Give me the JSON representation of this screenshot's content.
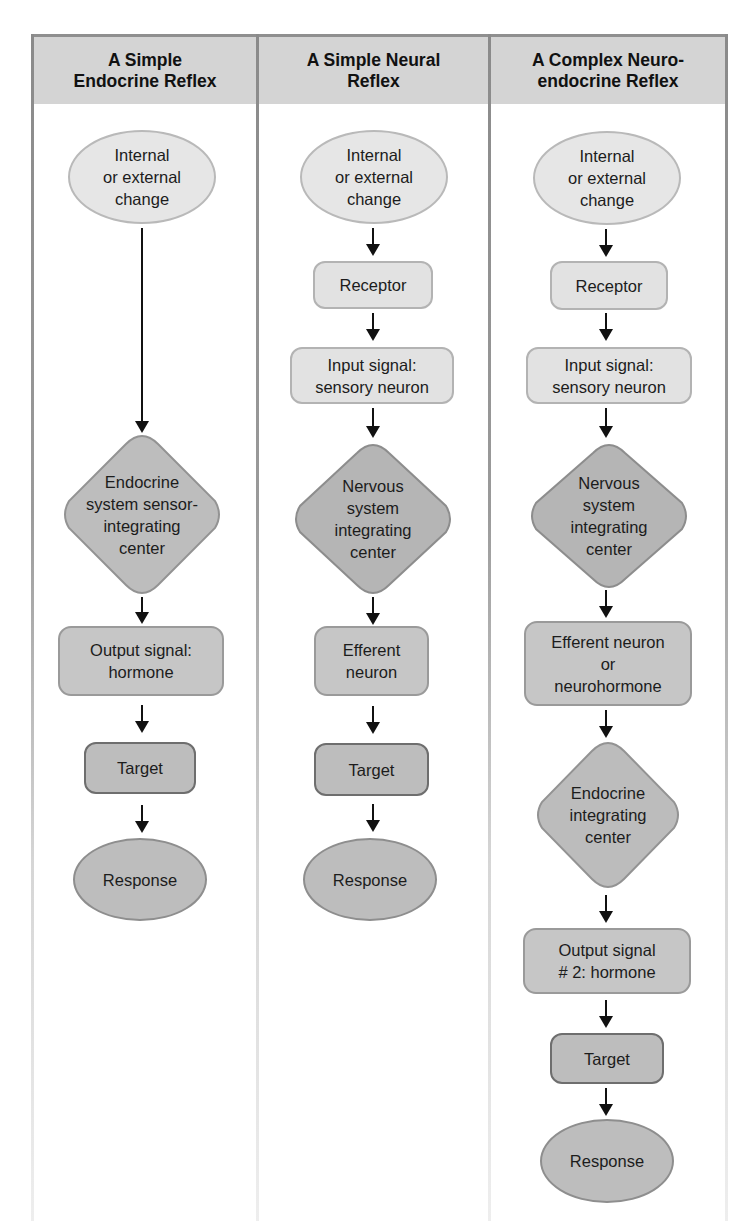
{
  "columns": [
    {
      "title": "A Simple\nEndocrine Reflex",
      "nodes": {
        "stimulus": "Internal\nor external\nchange",
        "integrating_center": "Endocrine\nsystem sensor-\nintegrating\ncenter",
        "output_signal": "Output signal:\nhormone",
        "target": "Target",
        "response": "Response"
      }
    },
    {
      "title": "A Simple Neural\nReflex",
      "nodes": {
        "stimulus": "Internal\nor external\nchange",
        "receptor": "Receptor",
        "input_signal": "Input signal:\nsensory neuron",
        "integrating_center": "Nervous\nsystem\nintegrating\ncenter",
        "efferent": "Efferent\nneuron",
        "target": "Target",
        "response": "Response"
      }
    },
    {
      "title": "A Complex Neuro-\nendocrine Reflex",
      "nodes": {
        "stimulus": "Internal\nor external\nchange",
        "receptor": "Receptor",
        "input_signal": "Input signal:\nsensory neuron",
        "integrating_center": "Nervous\nsystem\nintegrating\ncenter",
        "efferent": "Efferent neuron\nor\nneurohormone",
        "endocrine_center": "Endocrine\nintegrating\ncenter",
        "output_signal_2": "Output signal\n# 2: hormone",
        "target": "Target",
        "response": "Response"
      }
    }
  ],
  "colors": {
    "header_fill": "#d4d4d4",
    "light_fill": "#e4e4e4",
    "mid_fill": "#c6c6c6",
    "dark_fill": "#bdbdbd",
    "border": "#8f8f8f",
    "arrow": "#111111"
  }
}
